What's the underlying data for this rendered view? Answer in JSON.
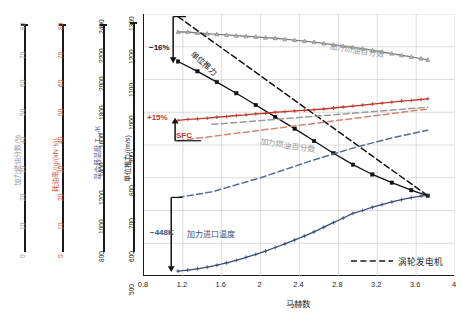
{
  "figure": {
    "background": "#ffffff"
  },
  "axes": {
    "x": {
      "title": "马赫数",
      "min": 0.8,
      "max": 4.0,
      "ticks": [
        "0.8",
        "1.2",
        "1.6",
        "2",
        "2.4",
        "2.8",
        "3.2",
        "3.6",
        "4"
      ],
      "tick_values": [
        0.8,
        1.2,
        1.6,
        2.0,
        2.4,
        2.8,
        3.2,
        3.6,
        4.0
      ]
    },
    "y_satellites": [
      {
        "id": "afterburner-fuel-fraction",
        "title": "加力燃油分数/%",
        "color": "#9a9a9a",
        "min": 0,
        "max": 80,
        "ticks": [
          "0",
          "10",
          "20",
          "30",
          "40",
          "50",
          "60",
          "70",
          "80"
        ],
        "tick_values": [
          0,
          10,
          20,
          30,
          40,
          50,
          60,
          70,
          80
        ]
      },
      {
        "id": "sfc",
        "title": "耗油率/(g/(kN·s))",
        "color": "#d4593f",
        "min": 0,
        "max": 80,
        "ticks": [
          "0",
          "10",
          "20",
          "30",
          "40",
          "50",
          "60",
          "70",
          "80"
        ],
        "tick_values": [
          0,
          10,
          20,
          30,
          40,
          50,
          60,
          70,
          80
        ]
      },
      {
        "id": "mixer-temperature",
        "title": "混合器温度 T₆₄/K",
        "color": "#5b6a93",
        "min": 800,
        "max": 2400,
        "ticks": [
          "800",
          "1000",
          "1200",
          "1400",
          "1600",
          "1800",
          "2000",
          "2200",
          "2400"
        ],
        "tick_values": [
          800,
          1000,
          1200,
          1400,
          1600,
          1800,
          2000,
          2200,
          2400
        ]
      },
      {
        "id": "specific-thrust",
        "title": "单位推力/(m/s)",
        "color": "#1a1a1a",
        "min": 500,
        "max": 1300,
        "ticks": [
          "500",
          "600",
          "700",
          "800",
          "900",
          "1000",
          "1100",
          "1200",
          "1300"
        ],
        "tick_values": [
          500,
          600,
          700,
          800,
          900,
          1000,
          1100,
          1200,
          1300
        ]
      }
    ]
  },
  "legend": {
    "items": [
      {
        "label": "涡轮发电机",
        "style": "dashed",
        "color": "#1a1a1a"
      }
    ]
  },
  "annotations": [
    {
      "id": "delta-specific-thrust",
      "text": "−16%",
      "color": "#1a1a1a"
    },
    {
      "id": "delta-sfc",
      "text": "+15%",
      "color": "#c0392b"
    },
    {
      "id": "delta-afterburner-inlet-temp",
      "text": "−448K",
      "color": "#3d4d7a"
    },
    {
      "id": "label-afterburner-inlet-temp",
      "text": "加力进口温度",
      "color": "#3d4d7a"
    },
    {
      "id": "label-sfc",
      "text": "SFC",
      "color": "#c0392b"
    },
    {
      "id": "label-specific-thrust",
      "text": "单位推力",
      "color": "#1a1a1a"
    },
    {
      "id": "label-afterburner-fuel-pct-solid",
      "text": "加力燃油百分数",
      "color": "#9a9a9a"
    },
    {
      "id": "label-afterburner-fuel-pct-dashed",
      "text": "加力燃油百分数",
      "color": "#9a9a9a"
    }
  ],
  "chart_data": {
    "type": "line",
    "title": "",
    "xlabel": "马赫数",
    "ylabel": "单位推力/(m/s)",
    "xlim": [
      0.8,
      4.0
    ],
    "ylim": [
      500,
      1300
    ],
    "grid": true,
    "legend_position": "bottom-right",
    "legend_entries": [
      "涡轮发电机"
    ],
    "series": [
      {
        "name": "加力燃油百分数 (本方案)",
        "style": "solid",
        "marker": "triangle",
        "color": "#7d7d7d",
        "axis": "加力燃油分数/%",
        "x": [
          1.15,
          1.25,
          1.35,
          1.45,
          1.55,
          1.65,
          1.75,
          1.85,
          1.95,
          2.05,
          2.15,
          2.25,
          2.35,
          2.45,
          2.55,
          2.65,
          2.75,
          2.85,
          2.95,
          3.05,
          3.15,
          3.25,
          3.35,
          3.45,
          3.55,
          3.65,
          3.72
        ],
        "values": [
          1245,
          1245,
          1242,
          1240,
          1238,
          1236,
          1234,
          1232,
          1230,
          1228,
          1226,
          1223,
          1220,
          1217,
          1214,
          1210,
          1206,
          1202,
          1198,
          1194,
          1189,
          1184,
          1179,
          1174,
          1169,
          1164,
          1160
        ]
      },
      {
        "name": "单位推力 (本方案)",
        "style": "solid",
        "marker": "square",
        "color": "#111111",
        "axis": "单位推力/(m/s)",
        "x": [
          1.15,
          1.35,
          1.55,
          1.75,
          1.95,
          2.15,
          2.35,
          2.55,
          2.75,
          2.95,
          3.15,
          3.35,
          3.55,
          3.72
        ],
        "values": [
          1155,
          1125,
          1092,
          1058,
          1022,
          986,
          950,
          912,
          875,
          840,
          810,
          785,
          762,
          745
        ]
      },
      {
        "name": "SFC 耗油率 (本方案)",
        "style": "solid",
        "marker": "plus",
        "color": "#c0392b",
        "axis": "耗油率/(g/(kN·s))",
        "x": [
          1.15,
          1.25,
          1.35,
          1.45,
          1.55,
          1.65,
          1.75,
          1.85,
          1.95,
          2.05,
          2.15,
          2.25,
          2.35,
          2.45,
          2.55,
          2.65,
          2.75,
          2.85,
          2.95,
          3.05,
          3.15,
          3.25,
          3.35,
          3.45,
          3.55,
          3.65,
          3.72
        ],
        "values": [
          975,
          978,
          980,
          982,
          985,
          987,
          990,
          992,
          995,
          997,
          1000,
          1002,
          1004,
          1006,
          1008,
          1010,
          1013,
          1016,
          1019,
          1022,
          1025,
          1028,
          1031,
          1034,
          1036,
          1039,
          1041
        ]
      },
      {
        "name": "加力进口温度 (本方案)",
        "style": "solid",
        "marker": "plus",
        "color": "#3d4d7a",
        "axis": "混合器温度 T₆₄/K",
        "x": [
          1.15,
          1.25,
          1.35,
          1.45,
          1.55,
          1.65,
          1.75,
          1.85,
          1.95,
          2.05,
          2.15,
          2.25,
          2.35,
          2.45,
          2.55,
          2.65,
          2.75,
          2.85,
          2.95,
          3.05,
          3.15,
          3.25,
          3.35,
          3.45,
          3.55,
          3.65,
          3.72
        ],
        "values": [
          515,
          518,
          522,
          527,
          533,
          540,
          548,
          557,
          566,
          576,
          587,
          598,
          610,
          622,
          635,
          649,
          663,
          677,
          691,
          700,
          710,
          718,
          726,
          733,
          739,
          744,
          746
        ]
      },
      {
        "name": "单位推力 (涡轮发电机)",
        "style": "dashed",
        "marker": "none",
        "color": "#111111",
        "axis": "单位推力/(m/s)",
        "x": [
          1.15,
          3.72
        ],
        "values": [
          1292,
          745
        ]
      },
      {
        "name": "加力燃油百分数 (涡轮发电机)",
        "style": "dashed",
        "marker": "none",
        "color": "#9a9a9a",
        "axis": "加力燃油分数/%",
        "x": [
          1.5,
          3.72
        ],
        "values": [
          963,
          1015
        ]
      },
      {
        "name": "SFC 耗油率 (涡轮发电机)",
        "style": "dashed",
        "marker": "none",
        "color": "#d4856f",
        "axis": "耗油率/(g/(kN·s))",
        "x": [
          1.15,
          3.72
        ],
        "values": [
          913,
          1010
        ]
      },
      {
        "name": "加力进口温度 (涡轮发电机)",
        "style": "dashed",
        "marker": "none",
        "color": "#5b6a93",
        "axis": "混合器温度 T₆₄/K",
        "x": [
          1.15,
          1.5,
          2.0,
          2.5,
          3.0,
          3.4,
          3.72
        ],
        "values": [
          740,
          757,
          800,
          850,
          895,
          925,
          945
        ]
      }
    ]
  }
}
